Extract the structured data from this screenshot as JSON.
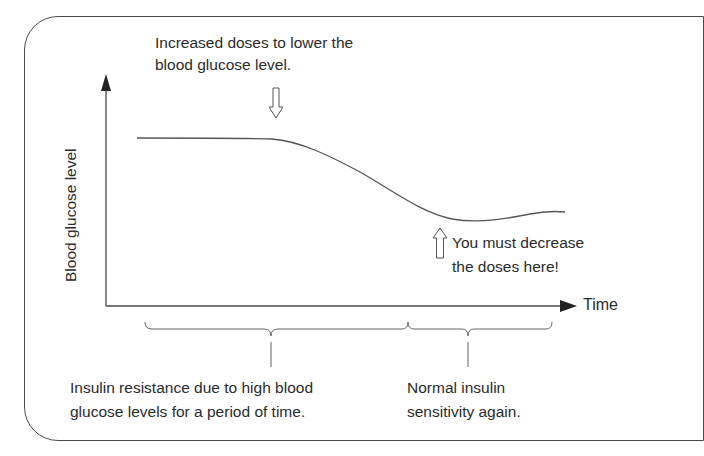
{
  "diagram": {
    "annotations": {
      "increase_line1": "Increased doses to lower the",
      "increase_line2": "blood glucose level.",
      "decrease_line1": "You must decrease",
      "decrease_line2": "the doses here!"
    },
    "axes": {
      "y_label": "Blood glucose level",
      "x_label": "Time"
    },
    "phases": [
      {
        "line1": "Insulin resistance due to high blood",
        "line2": "glucose levels for a period of time."
      },
      {
        "line1": "Normal insulin",
        "line2": "sensitivity again."
      }
    ],
    "icons": {
      "down_arrow": "hollow-down-arrow",
      "up_arrow": "hollow-up-arrow"
    },
    "colors": {
      "stroke": "#4a4a4a",
      "text": "#2b2b2b",
      "background": "#ffffff"
    }
  }
}
